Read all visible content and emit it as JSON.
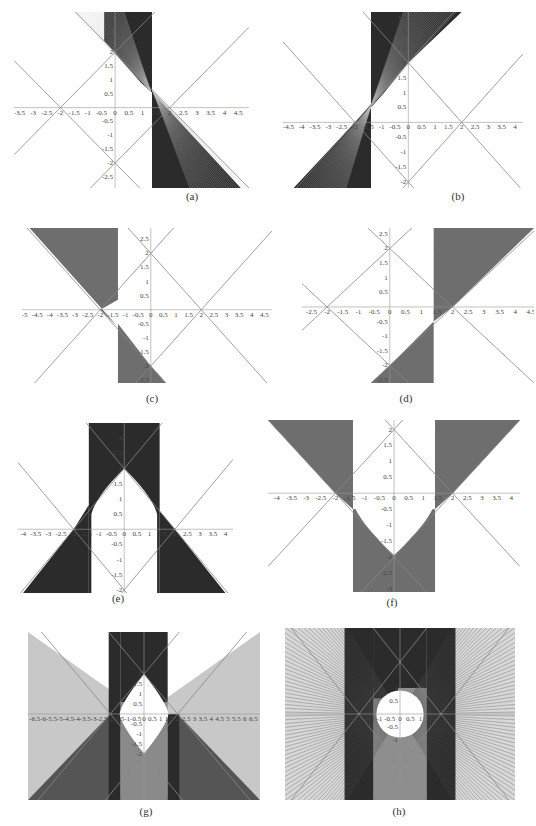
{
  "figure": {
    "panels": [
      {
        "id": "a",
        "caption": "(a)",
        "xlim": [
          -3.7,
          4.9
        ],
        "ylim": [
          -2.9,
          3.45
        ],
        "xticks": [
          -3.5,
          -3,
          -2.5,
          -2,
          -1.5,
          -1,
          -0.5,
          0,
          0.5,
          1,
          1.5,
          2,
          2.5,
          3,
          3.5,
          4,
          4.5
        ],
        "yticks": [
          -2.5,
          -2,
          -1.5,
          -1,
          -0.5,
          0.5,
          1,
          1.5,
          2,
          2.5,
          3
        ],
        "bands": [
          {
            "x0": 1.4,
            "x1": 1.4,
            "side": "right",
            "shade": "dark"
          }
        ],
        "style": "dark"
      },
      {
        "id": "b",
        "caption": "(b)",
        "xlim": [
          -4.7,
          4.3
        ],
        "ylim": [
          -2.2,
          3.7
        ],
        "xticks": [
          -4.5,
          -4,
          -3.5,
          -3,
          -2.5,
          -2,
          -1.5,
          -1,
          -0.5,
          0,
          0.5,
          1,
          1.5,
          2,
          2.5,
          3,
          3.5,
          4
        ],
        "yticks": [
          -2,
          -1.5,
          -1,
          -0.5,
          0.5,
          1,
          1.5,
          2,
          2.5,
          3,
          3.5
        ],
        "style": "dark"
      },
      {
        "id": "c",
        "caption": "(c)",
        "xlim": [
          -5.1,
          4.8
        ],
        "ylim": [
          -2.6,
          2.9
        ],
        "xticks": [
          -5,
          -4.5,
          -4,
          -3.5,
          -3,
          -2.5,
          -2,
          -1.5,
          -1,
          -0.5,
          0,
          0.5,
          1,
          1.5,
          2,
          2.5,
          3,
          3.5,
          4,
          4.5
        ],
        "yticks": [
          -2.5,
          -2,
          -1.5,
          -1,
          -0.5,
          0.5,
          1,
          1.5,
          2,
          2.5
        ],
        "style": "light"
      },
      {
        "id": "d",
        "caption": "(d)",
        "xlim": [
          -2.8,
          4.6
        ],
        "ylim": [
          -2.6,
          2.7
        ],
        "xticks": [
          -2.5,
          -2,
          -1.5,
          -1,
          -0.5,
          0,
          0.5,
          1,
          1.5,
          2,
          2.5,
          3,
          3.5,
          4,
          4.5
        ],
        "yticks": [
          -2.5,
          -2,
          -1.5,
          -1,
          -0.5,
          0.5,
          1,
          1.5,
          2,
          2.5
        ],
        "style": "light"
      },
      {
        "id": "e",
        "caption": "(e)",
        "xlim": [
          -4.2,
          4.3
        ],
        "ylim": [
          -2.1,
          3.5
        ],
        "xticks": [
          -4,
          -3.5,
          -3,
          -2.5,
          -2,
          -1.5,
          -1,
          -0.5,
          0,
          0.5,
          1,
          1.5,
          2,
          2.5,
          3,
          3.5,
          4
        ],
        "yticks": [
          -2,
          -1.5,
          -1,
          -0.5,
          0.5,
          1,
          1.5,
          2,
          2.5,
          3
        ],
        "style": "dark"
      },
      {
        "id": "f",
        "caption": "(f)",
        "xlim": [
          -4.3,
          4.3
        ],
        "ylim": [
          -3.1,
          2.3
        ],
        "xticks": [
          -4,
          -3.5,
          -3,
          -2.5,
          -2,
          -1.5,
          -1,
          -0.5,
          0,
          0.5,
          1,
          1.5,
          2,
          2.5,
          3,
          3.5,
          4
        ],
        "yticks": [
          -3,
          -2.5,
          -2,
          -1.5,
          -1,
          -0.5,
          0.5,
          1,
          1.5,
          2
        ],
        "style": "light"
      },
      {
        "id": "g",
        "caption": "(g)",
        "xlim": [
          -6.9,
          6.9
        ],
        "ylim": [
          -4.3,
          4.1
        ],
        "xticks": [
          -6.5,
          -6,
          -5.5,
          -5,
          -4.5,
          -4,
          -3.5,
          -3,
          -2.5,
          -2,
          -1.5,
          -1,
          -0.5,
          0,
          0.5,
          1,
          1.5,
          2,
          2.5,
          3,
          3.5,
          4,
          4.5,
          5,
          5.5,
          6,
          6.5
        ],
        "yticks": [
          -2,
          -1.5,
          -1,
          -0.5,
          0.5,
          1,
          1.5,
          2
        ],
        "style": "mixed"
      },
      {
        "id": "h",
        "caption": "(h)",
        "xlim": [
          -5.6,
          5.6
        ],
        "ylim": [
          -3.3,
          3.3
        ],
        "xticks": [
          -1.5,
          -1,
          -0.5,
          0,
          0.5,
          1
        ],
        "yticks": [
          -1,
          -0.5,
          0.5,
          1
        ],
        "style": "mixed"
      }
    ]
  }
}
